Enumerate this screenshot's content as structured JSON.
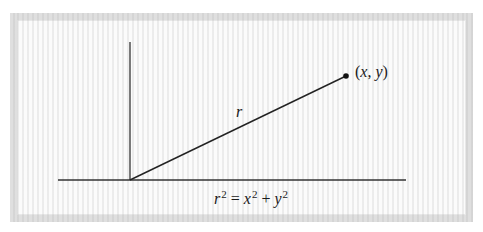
{
  "diagram": {
    "type": "polar-coordinate-diagram",
    "frame": {
      "border_color": "#dcdcdc",
      "background": "#ffffff"
    },
    "axes": {
      "color": "#333333",
      "origin": [
        130,
        180
      ],
      "vertical_top": [
        130,
        42
      ],
      "horizontal_left": [
        58,
        180
      ],
      "horizontal_right": [
        406,
        180
      ]
    },
    "radius_line": {
      "from": [
        130,
        180
      ],
      "to": [
        346,
        76
      ],
      "label": "r"
    },
    "point": {
      "position": [
        346,
        76
      ],
      "label_open": "(",
      "label_x": "x",
      "label_sep": ", ",
      "label_y": "y",
      "label_close": ")"
    },
    "equation": {
      "lhs_var": "r",
      "lhs_exp": "2",
      "equals": " = ",
      "term1_var": "x",
      "term1_exp": "2",
      "plus": " + ",
      "term2_var": "y",
      "term2_exp": "2",
      "full_text": "r² = x² + y²"
    }
  }
}
